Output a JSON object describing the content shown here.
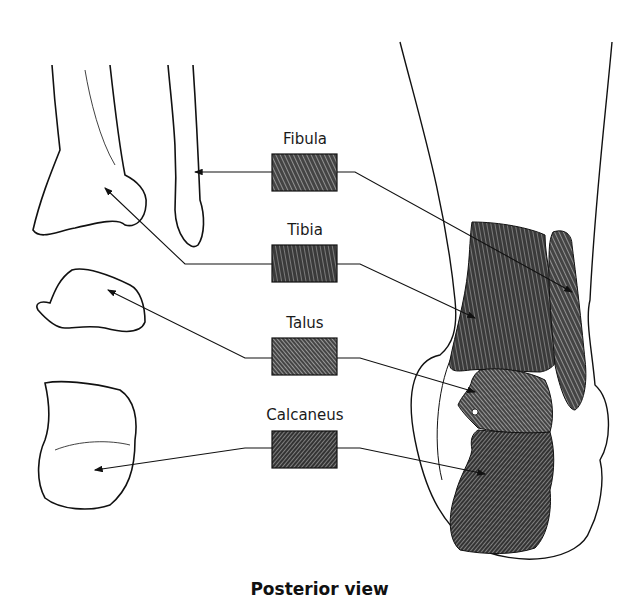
{
  "diagram": {
    "view": "Posterior view",
    "labels": [
      {
        "id": "fibula",
        "text": "Fibula"
      },
      {
        "id": "tibia",
        "text": "Tibia"
      },
      {
        "id": "talus",
        "text": "Talus"
      },
      {
        "id": "calcaneus",
        "text": "Calcaneus"
      }
    ]
  },
  "colors": {
    "ink": "#111111",
    "hatch": "#333333",
    "background": "#ffffff"
  }
}
